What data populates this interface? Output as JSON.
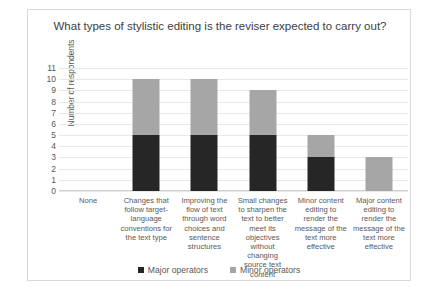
{
  "chart_data": {
    "type": "bar",
    "title": "What types of stylistic editing is the reviser expected to carry out?",
    "xlabel": "",
    "ylabel": "Number of respondents",
    "ylim": [
      0,
      11
    ],
    "ytick_step": 1,
    "grid": true,
    "stacked": true,
    "legend_position": "bottom",
    "categories": [
      "None",
      "Changes that follow target-language conventions for the text type",
      "Improving the flow of text through word choices and sentence structures",
      "Small changes to sharpen the text to better meet its objectives without changing source text content",
      "Minor content editing to render the message of the text more effective",
      "Major content editing to render the message of the text more effective"
    ],
    "yticks": [
      "0",
      "1",
      "2",
      "3",
      "4",
      "5",
      "6",
      "7",
      "8",
      "9",
      "10",
      "11"
    ],
    "series": [
      {
        "name": "Major operators",
        "color": "#262626",
        "values": [
          0,
          5,
          5,
          5,
          3,
          0
        ]
      },
      {
        "name": "Minor operators",
        "color": "#a6a6a6",
        "values": [
          0,
          5,
          5,
          4,
          2,
          3
        ]
      }
    ],
    "totals": [
      0,
      10,
      10,
      9,
      5,
      3
    ]
  }
}
